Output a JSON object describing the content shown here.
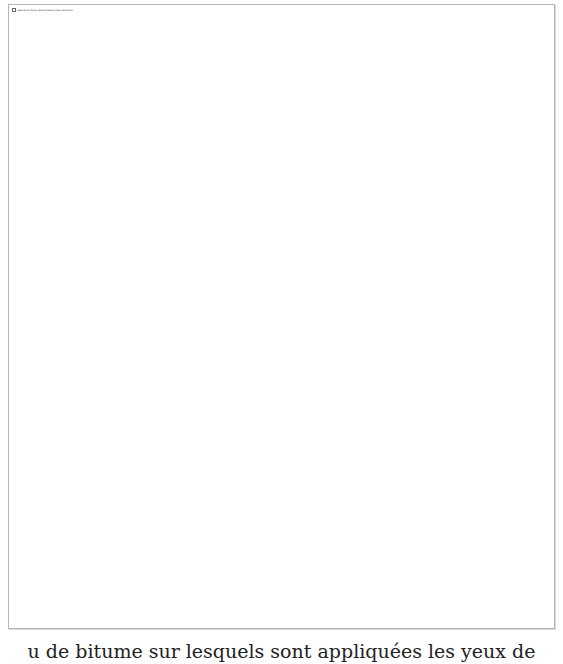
{
  "figure": {
    "caption": "Légende de figure (texte illisible à cette résolution)",
    "border_color": "#b5b5b5"
  },
  "text": {
    "bottom_line": "u de bitume sur lesquels sont appliquées les yeux de"
  }
}
